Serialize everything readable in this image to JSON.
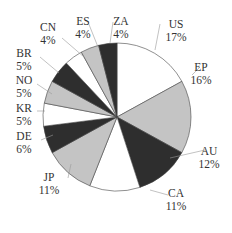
{
  "chart_data": {
    "type": "pie",
    "title": "",
    "start_angle": "12 o'clock",
    "direction": "clockwise",
    "categories": [
      "US",
      "EP",
      "AU",
      "CA",
      "JP",
      "DE",
      "KR",
      "NO",
      "BR",
      "CN",
      "ES",
      "ZA"
    ],
    "values": [
      17,
      16,
      12,
      11,
      11,
      6,
      5,
      5,
      5,
      4,
      4,
      4
    ],
    "labels": [
      "17%",
      "16%",
      "12%",
      "11%",
      "11%",
      "6%",
      "5%",
      "5%",
      "5%",
      "4%",
      "4%",
      "4%"
    ],
    "fills": [
      "#ffffff",
      "#c4c4c4",
      "#2e2e2e",
      "#ffffff",
      "#c4c4c4",
      "#2e2e2e",
      "#ffffff",
      "#c4c4c4",
      "#2e2e2e",
      "#ffffff",
      "#c4c4c4",
      "#2e2e2e"
    ],
    "legend": "none (leader-line labels)"
  },
  "cropped_header_text": ""
}
